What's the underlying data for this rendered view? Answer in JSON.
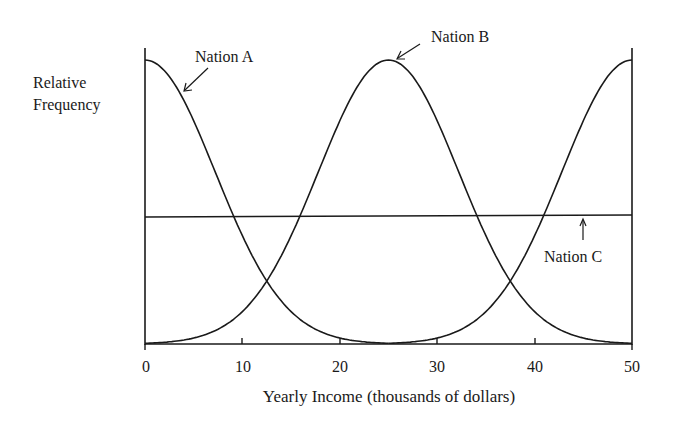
{
  "chart_data": {
    "type": "line",
    "title": "",
    "xlabel": "Yearly Income (thousands of dollars)",
    "ylabel": "Relative Frequency",
    "xlim": [
      0,
      50
    ],
    "ylim": [
      0,
      1
    ],
    "x_ticks": [
      0,
      10,
      20,
      30,
      40,
      50
    ],
    "x_tick_labels": [
      "0",
      "10",
      "20",
      "30",
      "40",
      "50"
    ],
    "grid": false,
    "legend": "none (curves labeled with arrows)",
    "series": [
      {
        "name": "Nation A",
        "shape": "half-normal peaked at x=0, decreasing",
        "x": [
          0,
          5,
          10,
          15,
          20,
          25
        ],
        "values": [
          1.0,
          0.72,
          0.27,
          0.06,
          0.01,
          0.0
        ]
      },
      {
        "name": "Nation B",
        "shape": "normal peaked at x=25 (overlaps bimodal-cyclic shape, peaks at 0 ... 25 ... 50 pattern)",
        "x": [
          0,
          5,
          10,
          15,
          20,
          25,
          30,
          35,
          40,
          45,
          50
        ],
        "values": [
          0.0,
          0.01,
          0.06,
          0.27,
          0.72,
          1.0,
          0.72,
          0.27,
          0.06,
          0.01,
          0.0
        ]
      },
      {
        "name": "Nation A (right tail)",
        "x": [
          25,
          30,
          35,
          40,
          45,
          50
        ],
        "values": [
          0.0,
          0.01,
          0.06,
          0.27,
          0.72,
          1.0
        ]
      },
      {
        "name": "Nation C",
        "shape": "uniform",
        "x": [
          0,
          50
        ],
        "values": [
          0.45,
          0.45
        ]
      }
    ],
    "annotations": [
      "Nation A",
      "Nation B",
      "Nation C"
    ]
  },
  "labels": {
    "ylabel_line1": "Relative",
    "ylabel_line2": "Frequency",
    "xlabel": "Yearly Income (thousands of dollars)",
    "nation_a": "Nation A",
    "nation_b": "Nation B",
    "nation_c": "Nation C",
    "ticks": [
      "0",
      "10",
      "20",
      "30",
      "40",
      "50"
    ]
  }
}
